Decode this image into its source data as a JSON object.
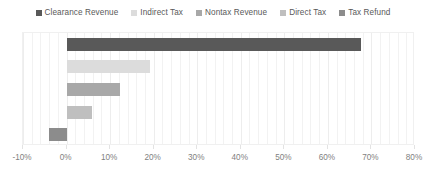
{
  "chart_data": {
    "type": "bar",
    "orientation": "horizontal",
    "title": "",
    "xlabel": "",
    "ylabel": "",
    "categories": [
      "Clearance Revenue",
      "Indirect Tax",
      "Nontax Revenue",
      "Direct Tax",
      "Tax Refund"
    ],
    "values": [
      67.5,
      19.2,
      12.2,
      5.9,
      -4.0
    ],
    "value_format": "percent",
    "xlim": [
      -10,
      80
    ],
    "xticks": [
      -10,
      0,
      10,
      20,
      30,
      40,
      50,
      60,
      70,
      80
    ],
    "xtick_labels": [
      "-10%",
      "0%",
      "10%",
      "20%",
      "30%",
      "40%",
      "50%",
      "60%",
      "70%",
      "80%"
    ],
    "minor_gridline_step": 2,
    "grid": true,
    "legend_position": "top",
    "series": [
      {
        "name": "Clearance Revenue",
        "value": 67.5,
        "color": "#595959"
      },
      {
        "name": "Indirect Tax",
        "value": 19.2,
        "color": "#dcdcdc"
      },
      {
        "name": "Nontax Revenue",
        "value": 12.2,
        "color": "#a8a8a8"
      },
      {
        "name": "Direct Tax",
        "value": 5.9,
        "color": "#bfbfbf"
      },
      {
        "name": "Tax Refund",
        "value": -4.0,
        "color": "#8c8c8c"
      }
    ]
  },
  "legend": {
    "items": [
      {
        "label": "Clearance Revenue",
        "color": "#595959"
      },
      {
        "label": "Indirect Tax",
        "color": "#dcdcdc"
      },
      {
        "label": "Nontax Revenue",
        "color": "#a8a8a8"
      },
      {
        "label": "Direct Tax",
        "color": "#bfbfbf"
      },
      {
        "label": "Tax Refund",
        "color": "#8c8c8c"
      }
    ]
  },
  "axis": {
    "labels": [
      "-10%",
      "0%",
      "10%",
      "20%",
      "30%",
      "40%",
      "50%",
      "60%",
      "70%",
      "80%"
    ]
  },
  "colors": {
    "plot_border": "#f0f0f0",
    "gridline": "#f2f2f2",
    "tick_text": "#7f7f7f",
    "legend_text": "#595959",
    "background": "#ffffff"
  }
}
